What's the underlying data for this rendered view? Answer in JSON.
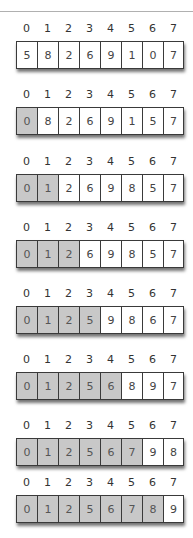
{
  "diagram": {
    "type": "selection-sort-steps",
    "indices": [
      "0",
      "1",
      "2",
      "3",
      "4",
      "5",
      "6",
      "7"
    ],
    "colors": {
      "sorted_fill": "#c8c8c8",
      "unsorted_fill": "#ffffff",
      "border": "#3a3a3a"
    },
    "steps": [
      {
        "values": [
          "5",
          "8",
          "2",
          "6",
          "9",
          "1",
          "0",
          "7"
        ],
        "sorted_count": 0
      },
      {
        "values": [
          "0",
          "8",
          "2",
          "6",
          "9",
          "1",
          "5",
          "7"
        ],
        "sorted_count": 1
      },
      {
        "values": [
          "0",
          "1",
          "2",
          "6",
          "9",
          "8",
          "5",
          "7"
        ],
        "sorted_count": 2
      },
      {
        "values": [
          "0",
          "1",
          "2",
          "6",
          "9",
          "8",
          "5",
          "7"
        ],
        "sorted_count": 3
      },
      {
        "values": [
          "0",
          "1",
          "2",
          "5",
          "9",
          "8",
          "6",
          "7"
        ],
        "sorted_count": 4
      },
      {
        "values": [
          "0",
          "1",
          "2",
          "5",
          "6",
          "8",
          "9",
          "7"
        ],
        "sorted_count": 5
      },
      {
        "values": [
          "0",
          "1",
          "2",
          "5",
          "6",
          "7",
          "9",
          "8"
        ],
        "sorted_count": 6
      },
      {
        "values": [
          "0",
          "1",
          "2",
          "5",
          "6",
          "7",
          "8",
          "9"
        ],
        "sorted_count": 7
      }
    ]
  }
}
